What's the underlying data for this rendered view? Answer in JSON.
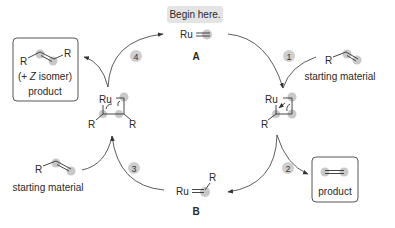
{
  "diagram": {
    "type": "catalytic-cycle",
    "title_callout": "Begin here.",
    "colors": {
      "highlight": "#b5b5b5",
      "callout_bg": "#e4e4e4",
      "ink": "#2a2a2a"
    },
    "species": {
      "A": {
        "label": "A",
        "formula_metal": "Ru",
        "description": "Ru methylidene"
      },
      "B": {
        "label": "B",
        "formula_metal": "Ru",
        "substituent": "R",
        "description": "Ru alkylidene"
      },
      "metallacycle_right": {
        "metal": "Ru",
        "substituent": "R"
      },
      "metallacycle_left": {
        "metal": "Ru",
        "substituents": [
          "R",
          "R"
        ]
      }
    },
    "steps": [
      {
        "number": "1"
      },
      {
        "number": "2"
      },
      {
        "number": "3"
      },
      {
        "number": "4"
      }
    ],
    "starting_material_right": {
      "substituent": "R",
      "label": "starting material"
    },
    "starting_material_left": {
      "substituent": "R",
      "label": "starting material"
    },
    "product_right": {
      "label": "product"
    },
    "product_left": {
      "substituents": [
        "R",
        "R"
      ],
      "isomer_note_prefix": "(+ ",
      "isomer_note_italic": "Z",
      "isomer_note_suffix": " isomer)",
      "label": "product"
    }
  }
}
